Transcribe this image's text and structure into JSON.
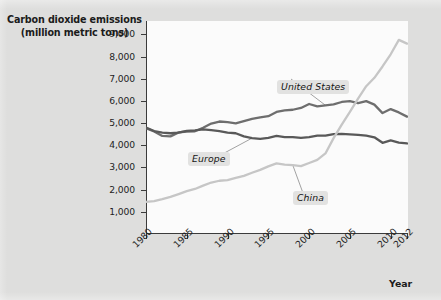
{
  "chart_data": {
    "type": "line",
    "title": "Carbon dioxide emissions (million metric tons)",
    "title_line1": "Carbon dioxide emissions",
    "title_line2": "(million metric tons)",
    "xlabel": "Year",
    "ylabel": "Carbon dioxide emissions (million metric tons)",
    "xlim": [
      1980,
      2012
    ],
    "ylim": [
      0,
      9600
    ],
    "grid": false,
    "legend_position": "inline-annotations",
    "ytick_labels": [
      "9,000",
      "8,000",
      "7,000",
      "6,000",
      "5,000",
      "4,000",
      "3,000",
      "2,000",
      "1,000"
    ],
    "ytick_values": [
      9000,
      8000,
      7000,
      6000,
      5000,
      4000,
      3000,
      2000,
      1000
    ],
    "xtick_labels": [
      "1980",
      "1985",
      "1990",
      "1995",
      "2000",
      "2005",
      "2010",
      "2012"
    ],
    "xtick_values": [
      1980,
      1985,
      1990,
      1995,
      2000,
      2005,
      2010,
      2012
    ],
    "x": [
      1980,
      1981,
      1982,
      1983,
      1984,
      1985,
      1986,
      1987,
      1988,
      1989,
      1990,
      1991,
      1992,
      1993,
      1994,
      1995,
      1996,
      1997,
      1998,
      1999,
      2000,
      2001,
      2002,
      2003,
      2004,
      2005,
      2006,
      2007,
      2008,
      2009,
      2010,
      2011,
      2012
    ],
    "series": [
      {
        "name": "United States",
        "color": "#6e6e6e",
        "label_text": "United States",
        "values": [
          4770,
          4620,
          4420,
          4400,
          4580,
          4620,
          4630,
          4790,
          4980,
          5070,
          5040,
          4990,
          5090,
          5190,
          5260,
          5310,
          5500,
          5570,
          5600,
          5680,
          5860,
          5750,
          5800,
          5840,
          5950,
          5990,
          5900,
          5990,
          5830,
          5450,
          5630,
          5480,
          5290
        ]
      },
      {
        "name": "Europe",
        "color": "#595959",
        "label_text": "Europe",
        "values": [
          4800,
          4640,
          4570,
          4540,
          4570,
          4650,
          4670,
          4720,
          4680,
          4640,
          4570,
          4540,
          4400,
          4320,
          4290,
          4330,
          4420,
          4370,
          4370,
          4330,
          4370,
          4430,
          4430,
          4500,
          4510,
          4490,
          4470,
          4430,
          4360,
          4110,
          4220,
          4120,
          4080
        ]
      },
      {
        "name": "China",
        "color": "#c6c6c6",
        "label_text": "China",
        "values": [
          1450,
          1480,
          1570,
          1670,
          1800,
          1930,
          2030,
          2180,
          2320,
          2400,
          2430,
          2530,
          2620,
          2760,
          2890,
          3050,
          3180,
          3130,
          3100,
          3060,
          3200,
          3340,
          3630,
          4320,
          4930,
          5500,
          6100,
          6660,
          7040,
          7550,
          8100,
          8750,
          8580
        ]
      }
    ],
    "annotations": [
      {
        "text": "United States",
        "series": "United States"
      },
      {
        "text": "Europe",
        "series": "Europe"
      },
      {
        "text": "China",
        "series": "China"
      }
    ]
  }
}
